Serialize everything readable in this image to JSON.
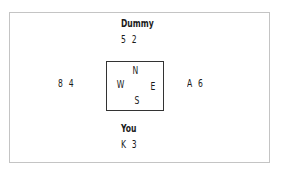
{
  "north": {
    "label": "Dummy",
    "cards": "5 2"
  },
  "south": {
    "label": "You",
    "cards": "K 3"
  },
  "west": {
    "cards": "8 4"
  },
  "east": {
    "cards": "A 6"
  },
  "compass": {
    "n": "N",
    "s": "S",
    "e": "E",
    "w": "W"
  }
}
